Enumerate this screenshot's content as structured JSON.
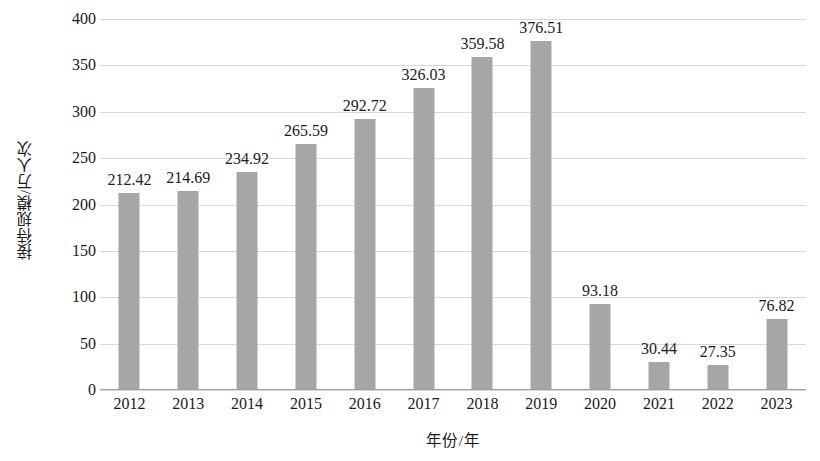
{
  "chart_data": {
    "type": "bar",
    "title": "",
    "xlabel": "年份/年",
    "ylabel": "接待规模/万人次",
    "categories": [
      "2012",
      "2013",
      "2014",
      "2015",
      "2016",
      "2017",
      "2018",
      "2019",
      "2020",
      "2021",
      "2022",
      "2023"
    ],
    "values": [
      212.42,
      214.69,
      234.92,
      265.59,
      292.72,
      326.03,
      359.58,
      376.51,
      93.18,
      30.44,
      27.35,
      76.82
    ],
    "data_labels": [
      "212.42",
      "214.69",
      "234.92",
      "265.59",
      "292.72",
      "326.03",
      "359.58",
      "376.51",
      "93.18",
      "30.44",
      "27.35",
      "76.82"
    ],
    "ylim": [
      0,
      400
    ],
    "ytick_step": 50,
    "ytick_labels": [
      "400",
      "350",
      "300",
      "250",
      "200",
      "150",
      "100",
      "50",
      "0"
    ],
    "ytick_values": [
      400,
      350,
      300,
      250,
      200,
      150,
      100,
      50,
      0
    ],
    "grid": true,
    "legend": null,
    "legend_position": "none",
    "bar_color": "#a6a6a6",
    "gridline_color": "#d7d7d7",
    "axis_color": "#9e9e9e",
    "background_color": "#ffffff",
    "text_color": "#1a1a1a"
  }
}
